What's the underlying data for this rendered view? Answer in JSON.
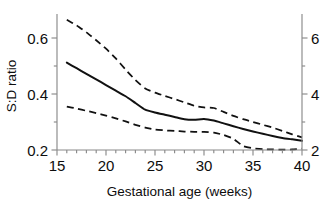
{
  "chart_data": {
    "type": "line",
    "title": "",
    "xlabel": "Gestational age (weeks)",
    "ylabel": "S:D ratio",
    "ylabel_right": "",
    "xlim": [
      15,
      40
    ],
    "ylim": [
      0.2,
      0.68
    ],
    "ylim_right": [
      2,
      6.8
    ],
    "grid": false,
    "legend": "none",
    "x_ticks": [
      15,
      20,
      25,
      30,
      35,
      40
    ],
    "x_tick_labels": [
      "15",
      "20",
      "25",
      "30",
      "35",
      "40"
    ],
    "x_minor_step": 1,
    "y_ticks": [
      0.2,
      0.4,
      0.6
    ],
    "y_tick_labels": [
      "0.2",
      "0.4",
      "0.6"
    ],
    "y_minor_ticks": [
      0.3,
      0.5
    ],
    "y_ticks_right": [
      2,
      4,
      6
    ],
    "y_tick_labels_right": [
      "2",
      "4",
      "6"
    ],
    "y_minor_ticks_right": [
      3,
      5
    ],
    "x": [
      16,
      17,
      18,
      19,
      20,
      21,
      22,
      23,
      24,
      25,
      26,
      27,
      28,
      29,
      30,
      31,
      32,
      33,
      34,
      35,
      36,
      37,
      38,
      39,
      40
    ],
    "series": [
      {
        "name": "upper-limit",
        "style": "dashed",
        "color": "#111111",
        "values": [
          0.665,
          0.645,
          0.62,
          0.592,
          0.562,
          0.527,
          0.487,
          0.45,
          0.42,
          0.405,
          0.393,
          0.382,
          0.37,
          0.358,
          0.352,
          0.35,
          0.336,
          0.322,
          0.31,
          0.3,
          0.29,
          0.28,
          0.268,
          0.256,
          0.245
        ]
      },
      {
        "name": "median",
        "style": "solid",
        "color": "#111111",
        "values": [
          0.512,
          0.492,
          0.472,
          0.452,
          0.432,
          0.412,
          0.392,
          0.368,
          0.344,
          0.334,
          0.326,
          0.318,
          0.31,
          0.308,
          0.311,
          0.305,
          0.295,
          0.285,
          0.275,
          0.266,
          0.258,
          0.25,
          0.243,
          0.238,
          0.233
        ]
      },
      {
        "name": "lower-limit",
        "style": "dashed",
        "color": "#111111",
        "values": [
          0.355,
          0.348,
          0.34,
          0.332,
          0.323,
          0.313,
          0.302,
          0.29,
          0.28,
          0.273,
          0.27,
          0.268,
          0.266,
          0.265,
          0.265,
          0.262,
          0.254,
          0.24,
          0.214,
          0.206,
          0.203,
          0.202,
          0.201,
          0.202,
          0.205
        ]
      }
    ]
  },
  "axes": {
    "left_title": "S:D ratio",
    "bottom_title": "Gestational age (weeks)"
  },
  "colors": {
    "line": "#111111",
    "axis": "#8a8a8a",
    "text": "#0d0d0d",
    "background": "#ffffff"
  }
}
